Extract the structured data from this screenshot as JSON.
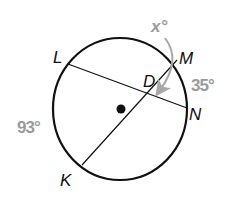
{
  "diagram": {
    "type": "circle-with-intersecting-chords",
    "circle": {
      "center_label": "",
      "has_center_dot": true
    },
    "points": {
      "L": "L",
      "M": "M",
      "N": "N",
      "K": "K",
      "D": "D"
    },
    "chords": [
      "LN",
      "MK"
    ],
    "intersection": "D",
    "arc_measures": {
      "arc_MN": "35°",
      "arc_LK": "93°"
    },
    "unknown_angle": {
      "label": "x°",
      "refers_to": "angle MDN"
    },
    "colors": {
      "stroke": "#111111",
      "measure_text": "#9a9a9a",
      "arrow": "#a8a8a8"
    }
  }
}
